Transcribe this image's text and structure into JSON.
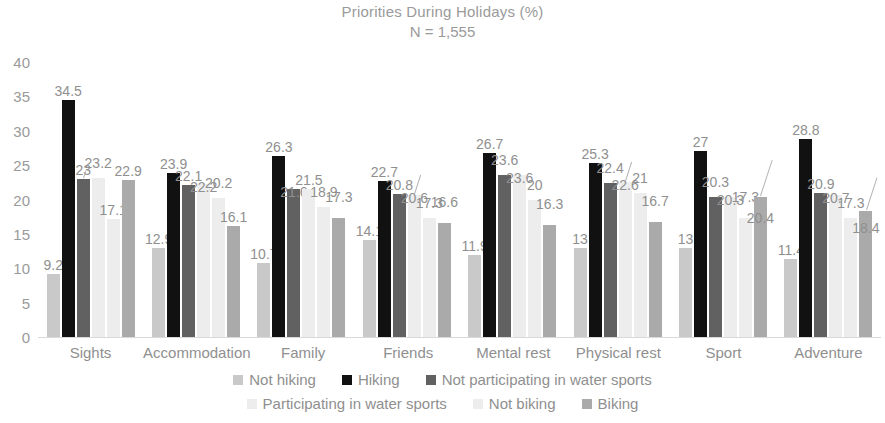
{
  "chart_data": {
    "type": "bar",
    "title": "Priorities During Holidays (%)",
    "subtitle": "N = 1,555",
    "xlabel": "",
    "ylabel": "",
    "ylim": [
      0,
      40
    ],
    "yticks": [
      0,
      5,
      10,
      15,
      20,
      25,
      30,
      35,
      40
    ],
    "grid": false,
    "legend_position": "bottom",
    "categories": [
      "Sights",
      "Accommodation",
      "Family",
      "Friends",
      "Mental rest",
      "Physical rest",
      "Sport",
      "Adventure"
    ],
    "series": [
      {
        "name": "Not hiking",
        "color": "#c9c9c9",
        "values": [
          9.2,
          12.9,
          10.7,
          14.1,
          11.9,
          13,
          13,
          11.4
        ],
        "labels": [
          "9.2",
          "12.9",
          "10.7",
          "14.1",
          "11.9",
          "13",
          "13",
          "11.4"
        ]
      },
      {
        "name": "Hiking",
        "color": "#111111",
        "values": [
          34.5,
          23.9,
          26.3,
          22.7,
          26.7,
          25.3,
          27,
          28.8
        ],
        "labels": [
          "34.5",
          "23.9",
          "26.3",
          "22.7",
          "26.7",
          "25.3",
          "27",
          "28.8"
        ]
      },
      {
        "name": "Not participating in water sports",
        "color": "#616161",
        "values": [
          23,
          22.1,
          21.6,
          20.8,
          23.6,
          22.4,
          20.3,
          20.9
        ],
        "labels": [
          "23",
          "22.1",
          "21.6",
          "20.8",
          "23.6",
          "22.4",
          "20.3",
          "20.9"
        ]
      },
      {
        "name": "Participating in water sports",
        "color": "#ededed",
        "values": [
          23.2,
          22.2,
          21.5,
          20.6,
          23.6,
          22.6,
          20.3,
          20.7
        ],
        "labels": [
          "23.2",
          "22.2",
          "21.5",
          "20.6",
          "23.6",
          "22.6",
          "20.3",
          "20.7"
        ]
      },
      {
        "name": "Not biking",
        "color": "#ededed",
        "values": [
          17.1,
          20.2,
          18.9,
          17.3,
          20,
          21,
          17.3,
          17.3
        ],
        "labels": [
          "17.1",
          "20.2",
          "18.9",
          "17.3",
          "20",
          "21",
          "17.3",
          "17.3"
        ]
      },
      {
        "name": "Biking",
        "color": "#aaaaaa",
        "values": [
          22.9,
          16.1,
          17.3,
          16.6,
          16.3,
          16.7,
          20.4,
          18.4
        ],
        "labels": [
          "22.9",
          "16.1",
          "17.3",
          "16.6",
          "16.3",
          "16.7",
          "20.4",
          "18.4"
        ]
      }
    ]
  }
}
